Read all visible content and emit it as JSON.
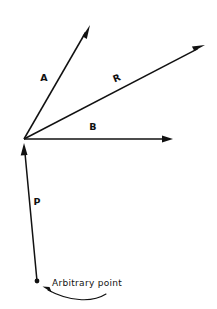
{
  "figure": {
    "background_color": "#ffffff",
    "ink_color": "#111111",
    "width": 217,
    "height": 309
  },
  "origin": {
    "label": "vector-origin",
    "x": 24,
    "y": 139
  },
  "vectors": [
    {
      "name": "A",
      "label": "A",
      "label_x": 44,
      "label_y": 81,
      "label_rotation": 0,
      "from_x": 24,
      "from_y": 139,
      "to_x": 90,
      "to_y": 25,
      "direction": "up-right-steep"
    },
    {
      "name": "R",
      "label": "R",
      "label_x": 118,
      "label_y": 81,
      "label_rotation": -22,
      "from_x": 24,
      "from_y": 139,
      "to_x": 205,
      "to_y": 45,
      "direction": "up-right-shallow"
    },
    {
      "name": "B",
      "label": "B",
      "label_x": 93,
      "label_y": 130,
      "label_rotation": 0,
      "from_x": 24,
      "from_y": 139,
      "to_x": 173,
      "to_y": 139,
      "direction": "right-horizontal"
    },
    {
      "name": "P",
      "label": "P",
      "label_x": 37,
      "label_y": 205,
      "label_rotation": 0,
      "from_x": 37,
      "from_y": 281,
      "to_x": 24,
      "to_y": 143,
      "direction": "up"
    }
  ],
  "annotation": {
    "name": "arbitrary-point",
    "text": "Arbitrary point",
    "text_x": 52,
    "text_y": 286,
    "dot_x": 37,
    "dot_y": 281,
    "leader_start_x": 106,
    "leader_start_y": 294,
    "leader_end_x": 44,
    "leader_end_y": 288
  }
}
